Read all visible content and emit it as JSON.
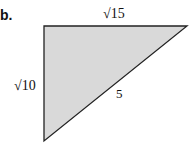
{
  "part_label": "b.",
  "triangle": {
    "fill": "#d9d9d9",
    "stroke": "#222222",
    "sides": {
      "top": "√15",
      "left": "√10",
      "hypotenuse": "5"
    }
  }
}
